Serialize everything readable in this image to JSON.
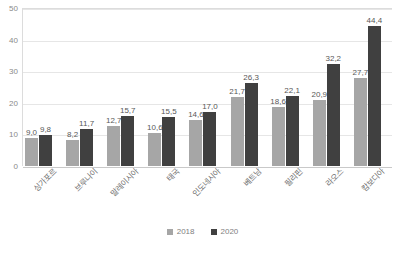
{
  "chart_data": {
    "type": "bar",
    "title": "",
    "subtitle": "",
    "xlabel": "",
    "ylabel": "",
    "ylim": [
      0,
      50
    ],
    "yticks": [
      "0",
      "10",
      "20",
      "30",
      "40",
      "50"
    ],
    "grid": true,
    "legend_position": "bottom",
    "decimal_separator": ",",
    "categories": [
      "싱가포르",
      "브루나이",
      "말레이시아",
      "태국",
      "인도네시아",
      "베트남",
      "필리핀",
      "라오스",
      "캄보디아"
    ],
    "series": [
      {
        "name": "2018",
        "color": "#a6a6a6",
        "values": [
          9.0,
          8.2,
          12.7,
          10.6,
          14.6,
          21.7,
          18.6,
          20.9,
          27.7
        ],
        "labels": [
          "9,0",
          "8,2",
          "12,7",
          "10,6",
          "14,6",
          "21,7",
          "18,6",
          "20,9",
          "27,7"
        ]
      },
      {
        "name": "2020",
        "color": "#404040",
        "values": [
          9.8,
          11.7,
          15.7,
          15.5,
          17.0,
          26.3,
          22.1,
          32.2,
          44.4
        ],
        "labels": [
          "9,8",
          "11,7",
          "15,7",
          "15,5",
          "17,0",
          "26,3",
          "22,1",
          "32,2",
          "44,4"
        ]
      }
    ]
  },
  "legend": {
    "items": [
      {
        "label": "2018"
      },
      {
        "label": "2020"
      }
    ]
  }
}
